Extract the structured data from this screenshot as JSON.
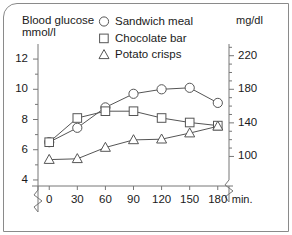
{
  "chart_data": {
    "type": "line",
    "title": "",
    "xlabel": "min.",
    "ylabel": "Blood glucose mmol/l",
    "y2label": "mg/dl",
    "x": [
      0,
      30,
      60,
      90,
      120,
      150,
      180
    ],
    "xtick_labels": [
      "0",
      "30",
      "60",
      "90",
      "120",
      "150",
      "180"
    ],
    "x_unit_label": "min.",
    "xlim": [
      -12,
      192
    ],
    "ylim": [
      3.6,
      12.6
    ],
    "ytick_values": [
      4,
      5,
      6,
      7,
      8,
      9,
      10,
      11,
      12
    ],
    "ytick_labels": [
      "4",
      "",
      "6",
      "",
      "8",
      "",
      "10",
      "",
      "12"
    ],
    "y2tick_values": [
      100,
      120,
      140,
      160,
      180,
      200,
      220
    ],
    "y2tick_labels": [
      "100",
      "",
      "140",
      "",
      "180",
      "",
      "220"
    ],
    "y2_conversion_note": "mg/dl = mmol/l x 18",
    "grid": false,
    "legend_position": "top-center",
    "axis_break": true,
    "series": [
      {
        "name": "Sandwich meal",
        "marker": "circle",
        "values": [
          6.5,
          7.45,
          8.8,
          9.7,
          10.0,
          10.1,
          9.1
        ]
      },
      {
        "name": "Chocolate bar",
        "marker": "square",
        "values": [
          6.5,
          8.1,
          8.55,
          8.55,
          8.1,
          7.8,
          7.6
        ]
      },
      {
        "name": "Potato crisps",
        "marker": "triangle",
        "values": [
          5.35,
          5.4,
          6.15,
          6.65,
          6.7,
          7.1,
          7.55
        ]
      }
    ]
  },
  "axes": {
    "y_title_line1": "Blood glucose",
    "y_title_line2": "mmol/l",
    "y2_title": "mg/dl"
  },
  "legend": {
    "items": [
      {
        "label": "Sandwich meal",
        "marker": "circle-marker-icon"
      },
      {
        "label": "Chocolate bar",
        "marker": "square-marker-icon"
      },
      {
        "label": "Potato crisps",
        "marker": "triangle-marker-icon"
      }
    ]
  },
  "colors": {
    "line": "#555555",
    "marker_stroke": "#555555",
    "marker_fill": "#ffffff",
    "axis": "#777777",
    "frame": "#8a8a8a",
    "text": "#1a1a1a"
  }
}
